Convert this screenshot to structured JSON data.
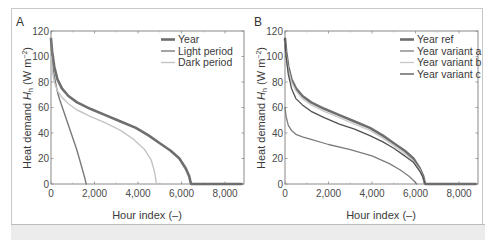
{
  "chart_data": [
    {
      "panel": "A",
      "type": "line",
      "xlabel": "Hour index (–)",
      "ylabel": "Heat demand H_h (W m⁻²)",
      "xlim": [
        0,
        8870
      ],
      "ylim": [
        0,
        120
      ],
      "xticks": [
        0,
        2000,
        4000,
        6000,
        8000
      ],
      "xtick_labels": [
        "0",
        "2,000",
        "4,000",
        "6,000",
        "8,000"
      ],
      "yticks": [
        0,
        20,
        40,
        60,
        80,
        100,
        120
      ],
      "ytick_labels": [
        "0",
        "20",
        "40",
        "60",
        "80",
        "100",
        "120"
      ],
      "grid": false,
      "legend_position": "upper right",
      "series": [
        {
          "name": "Year",
          "color": "#6e6e6e",
          "width": 2.6,
          "x": [
            0,
            50,
            150,
            300,
            500,
            800,
            1200,
            1800,
            2500,
            3200,
            3900,
            4500,
            5000,
            5500,
            5900,
            6200,
            6350,
            6420,
            6450,
            8760
          ],
          "y": [
            114,
            104,
            92,
            82,
            75,
            69,
            64,
            59,
            54,
            49,
            44,
            38,
            32,
            26,
            20,
            12,
            6,
            1,
            0,
            0
          ]
        },
        {
          "name": "Light period",
          "color": "#7a7a7a",
          "width": 1.4,
          "x": [
            0,
            40,
            100,
            200,
            300,
            400,
            600,
            800,
            1000,
            1200,
            1400,
            1550,
            1620
          ],
          "y": [
            114,
            104,
            90,
            80,
            72,
            66,
            56,
            46,
            36,
            26,
            14,
            5,
            0
          ]
        },
        {
          "name": "Dark period",
          "color": "#c4c4c4",
          "width": 1.4,
          "x": [
            0,
            50,
            150,
            300,
            500,
            800,
            1200,
            1800,
            2500,
            3200,
            3800,
            4300,
            4600,
            4750,
            4820,
            4850
          ],
          "y": [
            100,
            90,
            80,
            73,
            68,
            63,
            58,
            53,
            48,
            42,
            35,
            27,
            19,
            10,
            3,
            0
          ]
        }
      ]
    },
    {
      "panel": "B",
      "type": "line",
      "xlabel": "Hour index (–)",
      "ylabel": "Heat demand H_h (W m⁻²)",
      "xlim": [
        0,
        8870
      ],
      "ylim": [
        0,
        120
      ],
      "xticks": [
        0,
        2000,
        4000,
        6000,
        8000
      ],
      "xtick_labels": [
        "0",
        "2,000",
        "4,000",
        "6,000",
        "8,000"
      ],
      "yticks": [
        0,
        20,
        40,
        60,
        80,
        100,
        120
      ],
      "ytick_labels": [
        "0",
        "20",
        "40",
        "60",
        "80",
        "100",
        "120"
      ],
      "grid": false,
      "legend_position": "upper right",
      "series": [
        {
          "name": "Year ref",
          "color": "#6e6e6e",
          "width": 2.6,
          "x": [
            0,
            50,
            150,
            300,
            500,
            800,
            1200,
            1800,
            2500,
            3200,
            3900,
            4500,
            5000,
            5500,
            5900,
            6200,
            6350,
            6420,
            6450,
            8760
          ],
          "y": [
            114,
            104,
            92,
            82,
            75,
            69,
            64,
            59,
            54,
            49,
            44,
            38,
            32,
            26,
            20,
            12,
            6,
            1,
            0,
            0
          ]
        },
        {
          "name": "Year variant a",
          "color": "#7d7d7d",
          "width": 1.3,
          "x": [
            0,
            50,
            150,
            300,
            500,
            800,
            1200,
            2000,
            3000,
            4000,
            4800,
            5300,
            5700,
            5900,
            6000,
            6050
          ],
          "y": [
            60,
            53,
            46,
            42,
            39,
            37,
            35,
            31,
            27,
            22,
            16,
            11,
            6,
            3,
            1,
            0
          ]
        },
        {
          "name": "Year variant b",
          "color": "#c8c8c8",
          "width": 1.3,
          "x": [
            0,
            50,
            150,
            300,
            500,
            800,
            1200,
            1800,
            2500,
            3200,
            3900,
            4500,
            5000,
            5500,
            5900,
            6200,
            6350,
            6420,
            6450
          ],
          "y": [
            112,
            102,
            90,
            80,
            73,
            67,
            62,
            57,
            52,
            47,
            42,
            36,
            30,
            24,
            18,
            11,
            5,
            1,
            0
          ]
        },
        {
          "name": "Year variant c",
          "color": "#505050",
          "width": 1.3,
          "x": [
            0,
            50,
            150,
            300,
            500,
            800,
            1200,
            1800,
            2500,
            3200,
            3900,
            4500,
            5000,
            5500,
            5900,
            6200,
            6350,
            6420,
            6450
          ],
          "y": [
            114,
            100,
            86,
            75,
            67,
            62,
            57,
            52,
            47,
            43,
            38,
            33,
            28,
            22,
            17,
            10,
            5,
            1,
            0
          ]
        }
      ]
    }
  ],
  "panels": {
    "a": {
      "label": "A",
      "xlabel": "Hour index (–)",
      "ylabel_prefix": "Heat demand ",
      "ylabel_var": "H",
      "ylabel_sub": "h",
      "ylabel_unit": " (W m",
      "ylabel_exp": "−2",
      "ylabel_close": ")"
    },
    "b": {
      "label": "B",
      "xlabel": "Hour index (–)",
      "ylabel_prefix": "Heat demand ",
      "ylabel_var": "H",
      "ylabel_sub": "h",
      "ylabel_unit": " (W m",
      "ylabel_exp": "−2",
      "ylabel_close": ")"
    }
  }
}
